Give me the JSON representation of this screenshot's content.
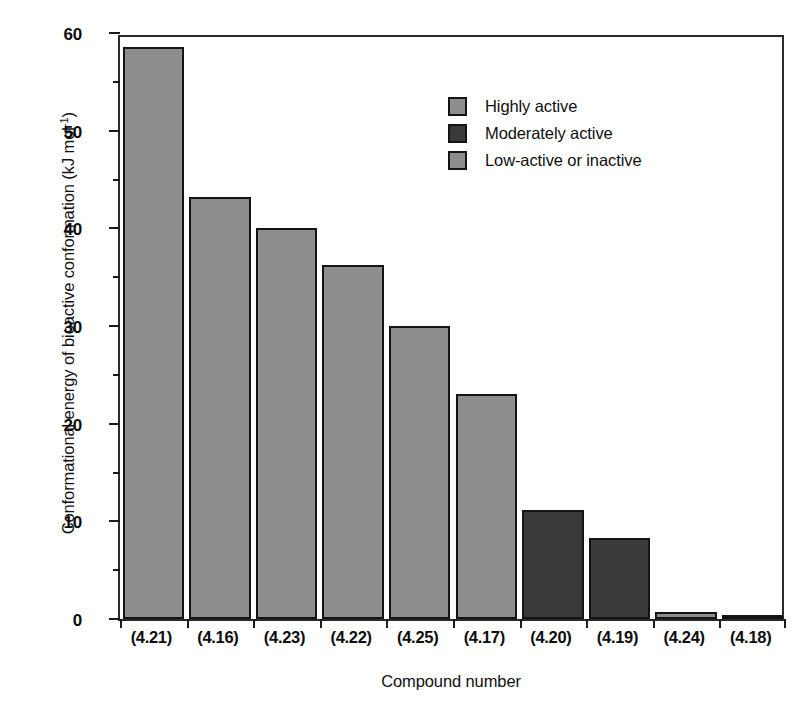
{
  "chart_data": {
    "type": "bar",
    "title": "",
    "xlabel": "Compound number",
    "ylabel": "Conformational energy of bioactive conformation (kJ mol⁻¹)",
    "ylabel_base": "Conformational energy of bioactive conformation (kJ mol",
    "ylabel_sup": "-1",
    "ylabel_tail": ")",
    "categories": [
      "(4.21)",
      "(4.16)",
      "(4.23)",
      "(4.22)",
      "(4.25)",
      "(4.17)",
      "(4.20)",
      "(4.19)",
      "(4.24)",
      "(4.18)"
    ],
    "values": [
      58.6,
      43.2,
      40.0,
      36.2,
      30.0,
      23.0,
      11.2,
      8.3,
      0.7,
      0.3
    ],
    "bar_groups": [
      "Highly active",
      "Highly active",
      "Highly active",
      "Highly active",
      "Highly active",
      "Highly active",
      "Moderately active",
      "Moderately active",
      "Low-active or inactive",
      "Low-active or inactive"
    ],
    "ylim": [
      0,
      60
    ],
    "ytick_labels": [
      "0",
      "10",
      "20",
      "30",
      "40",
      "50",
      "60"
    ],
    "ytick_values": [
      0,
      10,
      20,
      30,
      40,
      50,
      60
    ],
    "yminor_values": [
      5,
      15,
      25,
      35,
      45,
      55
    ],
    "grid": false,
    "legend_position": "upper-center",
    "legend": [
      {
        "label": "Highly active",
        "swatch": "light",
        "color": "#8d8d8d"
      },
      {
        "label": "Moderately active",
        "swatch": "dark",
        "color": "#3a3a3a"
      },
      {
        "label": "Low-active or inactive",
        "swatch": "light",
        "color": "#8d8d8d"
      }
    ],
    "colors": {
      "light_gray": "#8d8d8d",
      "dark_gray": "#3a3a3a",
      "outline": "#141414",
      "background": "#ffffff"
    }
  }
}
